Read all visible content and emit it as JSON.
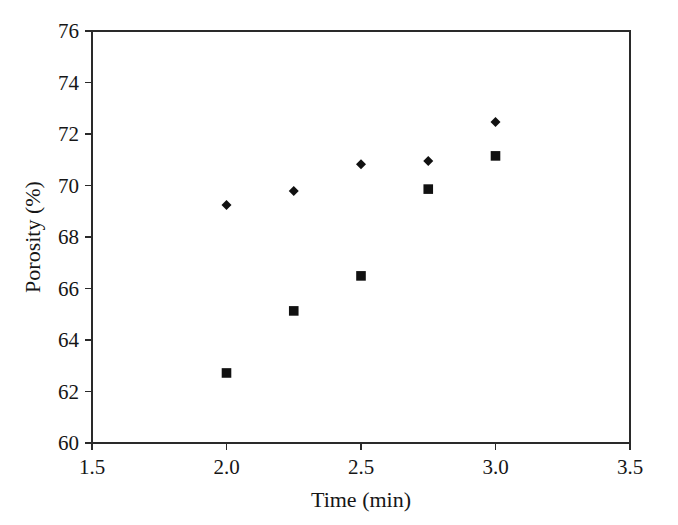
{
  "chart_data": {
    "type": "scatter",
    "title": "",
    "xlabel": "Time (min)",
    "ylabel": "Porosity (%)",
    "xlim": [
      1.5,
      3.5
    ],
    "ylim": [
      60,
      76
    ],
    "xticks": [
      "1.5",
      "2.0",
      "2.5",
      "3.0",
      "3.5"
    ],
    "xtick_values": [
      1.5,
      2.0,
      2.5,
      3.0,
      3.5
    ],
    "yticks": [
      "60",
      "62",
      "64",
      "66",
      "68",
      "70",
      "72",
      "74",
      "76"
    ],
    "ytick_values": [
      60,
      62,
      64,
      66,
      68,
      70,
      72,
      74,
      76
    ],
    "grid": false,
    "legend": "none",
    "marker_color": "#111111",
    "axis_color": "#2a2a2a",
    "background": "#ffffff",
    "series": [
      {
        "name": "series-diamond",
        "marker": "diamond",
        "x": [
          2.0,
          2.25,
          2.5,
          2.75,
          3.0
        ],
        "values": [
          69.24,
          69.79,
          70.83,
          70.95,
          72.47
        ]
      },
      {
        "name": "series-square",
        "marker": "square",
        "x": [
          2.0,
          2.25,
          2.5,
          2.75,
          3.0
        ],
        "values": [
          62.72,
          65.13,
          66.49,
          69.86,
          71.15
        ]
      }
    ]
  }
}
